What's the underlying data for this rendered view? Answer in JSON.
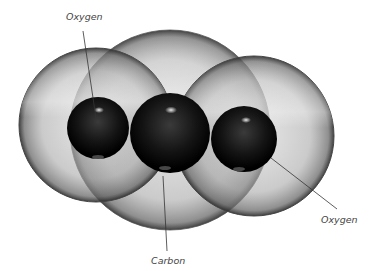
{
  "diagram": {
    "labels": {
      "oxygen_left": "Oxygen",
      "carbon": "Carbon",
      "oxygen_right": "Oxygen"
    },
    "atoms": [
      {
        "name": "Oxygen",
        "position": "left"
      },
      {
        "name": "Carbon",
        "position": "center"
      },
      {
        "name": "Oxygen",
        "position": "right"
      }
    ],
    "colors": {
      "shell": "#b8b8b8",
      "nucleus": "#0a0a0a",
      "leader_line": "#333333"
    }
  }
}
